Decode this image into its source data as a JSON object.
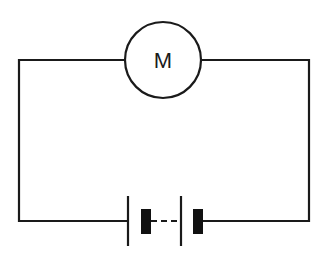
{
  "diagram": {
    "type": "electrical circuit schematic",
    "components": [
      {
        "name": "motor",
        "label": "M",
        "symbol": "circle"
      },
      {
        "name": "battery",
        "label": "",
        "symbol": "two cells in series (long/short plates, dashed link)"
      }
    ],
    "colors": {
      "stroke": "#1a1a1a",
      "background": "#ffffff"
    }
  },
  "motor": {
    "label": "M"
  }
}
